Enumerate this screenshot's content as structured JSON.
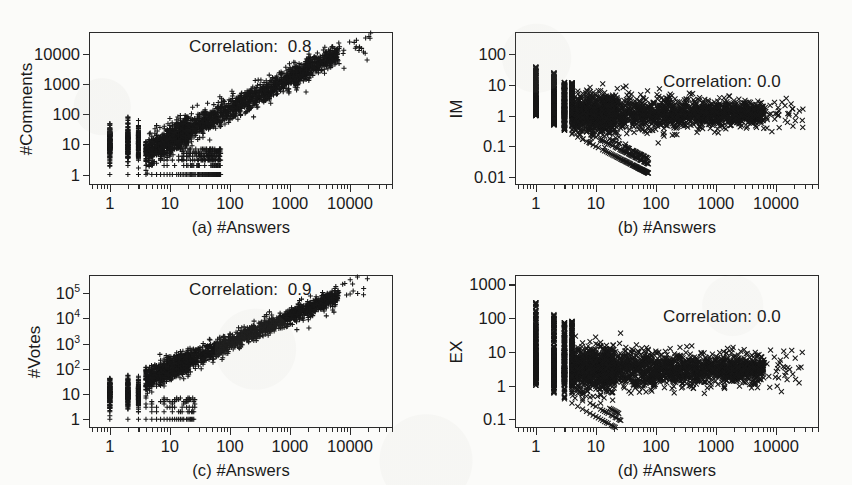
{
  "figure": {
    "background_color": "#fbfbf9",
    "ink_color": "#1a1a1a",
    "layout": "2x2 grid of log-log scatter plots"
  },
  "chart_data": [
    {
      "id": "a",
      "type": "scatter",
      "title": "",
      "xlabel": "(a) #Answers",
      "ylabel": "#Comments",
      "annotation": "Correlation:  0.8",
      "correlation": 0.8,
      "marker": "+",
      "xscale": "log",
      "yscale": "log",
      "xlim": [
        0.45,
        52000
      ],
      "ylim": [
        0.45,
        52000
      ],
      "xticks": [
        "1",
        "10",
        "100",
        "1000",
        "10000"
      ],
      "xtick_values": [
        1,
        10,
        100,
        1000,
        10000
      ],
      "yticks": [
        "1",
        "10",
        "100",
        "1000",
        "10000"
      ],
      "ytick_values": [
        1,
        10,
        100,
        1000,
        10000
      ],
      "grid": false,
      "n_points_approx": 3000,
      "trend": "strong positive power-law relation; #Comments grows roughly linearly with #Answers on log-log axes"
    },
    {
      "id": "b",
      "type": "scatter",
      "title": "",
      "xlabel": "(b) #Answers",
      "ylabel": "IM",
      "annotation": "Correlation: 0.0",
      "correlation": 0.0,
      "marker": "x",
      "xscale": "log",
      "yscale": "log",
      "xlim": [
        0.45,
        52000
      ],
      "ylim": [
        0.0055,
        520
      ],
      "xticks": [
        "1",
        "10",
        "100",
        "1000",
        "10000"
      ],
      "xtick_values": [
        1,
        10,
        100,
        1000,
        10000
      ],
      "yticks": [
        "100",
        "10",
        "1",
        "0.1",
        "0.01"
      ],
      "ytick_values": [
        100,
        10,
        1,
        0.1,
        0.01
      ],
      "grid": false,
      "n_points_approx": 3000,
      "trend": "flat cloud centered near IM = 1 with a sharp lower envelope decaying as 1/#Answers"
    },
    {
      "id": "c",
      "type": "scatter",
      "title": "",
      "xlabel": "(c) #Answers",
      "ylabel": "#Votes",
      "annotation": "Correlation:  0.9",
      "correlation": 0.9,
      "marker": "+",
      "xscale": "log",
      "yscale": "log",
      "xlim": [
        0.45,
        52000
      ],
      "ylim": [
        0.45,
        520000
      ],
      "xticks": [
        "1",
        "10",
        "100",
        "1000",
        "10000"
      ],
      "xtick_values": [
        1,
        10,
        100,
        1000,
        10000
      ],
      "yticks": [
        "10^5",
        "10^4",
        "10^3",
        "10^2",
        "10",
        "1"
      ],
      "ytick_values": [
        100000,
        10000,
        1000,
        100,
        10,
        1
      ],
      "ytick_html": [
        "10<sup>5</sup>",
        "10<sup>4</sup>",
        "10<sup>3</sup>",
        "10<sup>2</sup>",
        "10",
        "1"
      ],
      "grid": false,
      "n_points_approx": 3000,
      "trend": "very strong positive power-law relation between #Answers and #Votes"
    },
    {
      "id": "d",
      "type": "scatter",
      "title": "",
      "xlabel": "(d) #Answers",
      "ylabel": "EX",
      "annotation": "Correlation: 0.0",
      "correlation": 0.0,
      "marker": "x",
      "xscale": "log",
      "yscale": "log",
      "xlim": [
        0.45,
        52000
      ],
      "ylim": [
        0.055,
        1900
      ],
      "xticks": [
        "1",
        "10",
        "100",
        "1000",
        "10000"
      ],
      "xtick_values": [
        1,
        10,
        100,
        1000,
        10000
      ],
      "yticks": [
        "1000",
        "100",
        "10",
        "1",
        "0.1"
      ],
      "ytick_values": [
        1000,
        100,
        10,
        1,
        0.1
      ],
      "grid": false,
      "n_points_approx": 3000,
      "trend": "flat cloud centered near EX = 3 with a lower envelope decaying as 1/#Answers"
    }
  ]
}
